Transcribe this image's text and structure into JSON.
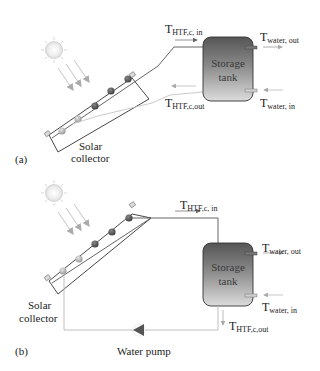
{
  "panels": [
    {
      "id": "a",
      "panel_label": "(a)",
      "collector_label_line1": "Solar",
      "collector_label_line2": "collector",
      "tank_label_line1": "Storage",
      "tank_label_line2": "tank",
      "htf_in": {
        "main": "T",
        "sub": "HTF,c, in"
      },
      "htf_out": {
        "main": "T",
        "sub": "HTF,c,out"
      },
      "water_out": {
        "main": "T",
        "sub": "water, out"
      },
      "water_in": {
        "main": "T",
        "sub": "water, in"
      }
    },
    {
      "id": "b",
      "panel_label": "(b)",
      "collector_label_line1": "Solar",
      "collector_label_line2": "collector",
      "tank_label_line1": "Storage",
      "tank_label_line2": "tank",
      "htf_in": {
        "main": "T",
        "sub": "HTF,c, in"
      },
      "htf_out": {
        "main": "T",
        "sub": "HTF,c,out"
      },
      "water_out": {
        "main": "T",
        "sub": "water, out"
      },
      "water_in": {
        "main": "T",
        "sub": "water, in"
      },
      "pump_label": "Water pump"
    }
  ],
  "colors": {
    "tank_top": "#5a5a5a",
    "tank_bottom": "#d8d8d8",
    "pipe": "#555555",
    "pipe_light": "#b8b8b8",
    "tube_dark": "#5b5b5b",
    "tube_light": "#bdbdbd",
    "sun": "#e6e6e6",
    "ray": "#cfcfcf"
  }
}
